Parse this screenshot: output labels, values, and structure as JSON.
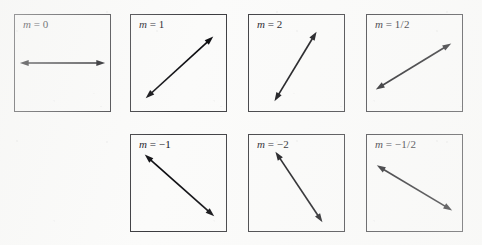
{
  "figure": {
    "background_color": "#fbfbfa",
    "border_color": "#3a3a3e",
    "arrow_color": "#0d0d11",
    "rows": 2,
    "columns": 4
  },
  "chart_data": {
    "type": "line",
    "xlabel": "",
    "ylabel": "",
    "categories": [
      "m = 0",
      "m = 1",
      "m = 2",
      "m = 1/2",
      "m = -1",
      "m = -2",
      "m = -1/2"
    ],
    "values": [
      0,
      1,
      2,
      0.5,
      -1,
      -2,
      -0.5
    ],
    "series": [
      {
        "name": "slope",
        "values": [
          0,
          1,
          2,
          0.5,
          -1,
          -2,
          -0.5
        ]
      }
    ],
    "legend_position": "none",
    "grid": false
  },
  "panels": [
    {
      "id": "panel-slope-0",
      "label_variable": "m",
      "label_equals": "=",
      "label_value": "0",
      "label_full": "m = 0",
      "slope": 0,
      "slope_text": "0",
      "row": 1,
      "column": 1,
      "x": 14,
      "y": 14,
      "arrow": {
        "x1": 5,
        "y1": 49,
        "x2": 92,
        "y2": 49,
        "double_headed": true
      }
    },
    {
      "id": "panel-slope-1",
      "label_variable": "m",
      "label_equals": "=",
      "label_value": "1",
      "label_full": "m = 1",
      "slope": 1,
      "slope_text": "1",
      "row": 1,
      "column": 2,
      "x": 130,
      "y": 14,
      "arrow": {
        "x1": 15,
        "y1": 85,
        "x2": 84,
        "y2": 22,
        "double_headed": true
      }
    },
    {
      "id": "panel-slope-2",
      "label_variable": "m",
      "label_equals": "=",
      "label_value": "2",
      "label_full": "m = 2",
      "slope": 2,
      "slope_text": "2",
      "row": 1,
      "column": 3,
      "x": 248,
      "y": 14,
      "arrow": {
        "x1": 26,
        "y1": 88,
        "x2": 69,
        "y2": 17,
        "double_headed": true
      }
    },
    {
      "id": "panel-slope-half",
      "label_variable": "m",
      "label_equals": "=",
      "label_value": "1/2",
      "label_full": "m = 1/2",
      "slope": 0.5,
      "slope_text": "1/2",
      "row": 1,
      "column": 4,
      "x": 366,
      "y": 14,
      "arrow": {
        "x1": 9,
        "y1": 76,
        "x2": 86,
        "y2": 29,
        "double_headed": true
      }
    },
    {
      "id": "panel-slope-neg1",
      "label_variable": "m",
      "label_equals": "=",
      "label_value": "−1",
      "label_full": "m = −1",
      "slope": -1,
      "slope_text": "−1",
      "row": 2,
      "column": 2,
      "x": 130,
      "y": 134,
      "arrow": {
        "x1": 14,
        "y1": 20,
        "x2": 85,
        "y2": 83,
        "double_headed": true
      }
    },
    {
      "id": "panel-slope-neg2",
      "label_variable": "m",
      "label_equals": "=",
      "label_value": "−2",
      "label_full": "m = −2",
      "slope": -2,
      "slope_text": "−2",
      "row": 2,
      "column": 3,
      "x": 248,
      "y": 134,
      "arrow": {
        "x1": 27,
        "y1": 17,
        "x2": 75,
        "y2": 89,
        "double_headed": true
      }
    },
    {
      "id": "panel-slope-neghalf",
      "label_variable": "m",
      "label_equals": "=",
      "label_value": "−1/2",
      "label_full": "m = −1/2",
      "slope": -0.5,
      "slope_text": "−1/2",
      "row": 2,
      "column": 4,
      "x": 366,
      "y": 134,
      "arrow": {
        "x1": 10,
        "y1": 31,
        "x2": 87,
        "y2": 77,
        "double_headed": true
      }
    }
  ]
}
